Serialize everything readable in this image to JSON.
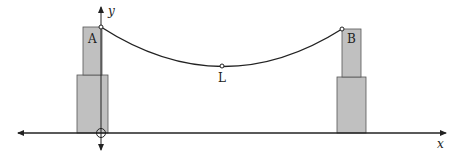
{
  "diagram": {
    "labels": {
      "tower_a": "A",
      "tower_b": "B",
      "low_point": "L",
      "x_axis": "x",
      "y_axis": "y"
    },
    "colors": {
      "tower_fill": "#c0c0c0",
      "stroke": "#222222",
      "background": "#ffffff"
    }
  }
}
